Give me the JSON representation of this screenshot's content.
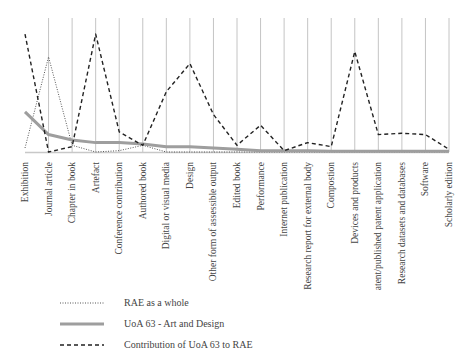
{
  "chart_data": {
    "type": "line",
    "title": "",
    "xlabel": "",
    "ylabel": "",
    "ylim": [
      0,
      100
    ],
    "grid": "vertical",
    "legend_position": "bottom-left",
    "categories": [
      "Exhibition",
      "Journal article",
      "Chapter in book",
      "Artefact",
      "Conference contribution",
      "Authored book",
      "Digital or visual media",
      "Design",
      "Other form of assessible output",
      "Edited book",
      "Performance",
      "Internet publication",
      "Research report for external body",
      "Compostion",
      "Devices and products",
      "Patent/published patent application",
      "Research datasets and databases",
      "Software",
      "Scholarly edition"
    ],
    "series": [
      {
        "name": "RAE as a whole",
        "style": "dotted",
        "color": "#555555",
        "values": [
          3,
          71,
          5,
          0,
          1,
          5,
          0,
          0,
          0,
          0,
          0,
          0,
          0,
          0,
          0,
          0,
          0,
          0,
          0
        ]
      },
      {
        "name": "UoA 63 - Art and Design",
        "style": "solid",
        "color": "#9e9e9e",
        "values": [
          30,
          13,
          9,
          7,
          7,
          6,
          4,
          4,
          3,
          2,
          1,
          1,
          1,
          0.5,
          0.5,
          0.5,
          0.5,
          0.5,
          0.5
        ]
      },
      {
        "name": "Contribution of UoA 63 to RAE",
        "style": "dashed",
        "color": "#222222",
        "values": [
          88,
          0,
          4,
          88,
          15,
          5,
          45,
          66,
          28,
          5,
          20,
          1,
          7,
          4,
          75,
          13,
          14,
          13,
          2
        ]
      }
    ]
  },
  "legend": {
    "items": [
      {
        "label": "RAE as a whole"
      },
      {
        "label": "UoA 63 - Art and Design"
      },
      {
        "label": "Contribution of UoA 63 to RAE"
      }
    ]
  }
}
